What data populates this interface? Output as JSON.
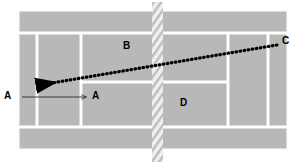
{
  "diagram": {
    "colors": {
      "court_surface": "#b8b8b8",
      "court_line": "#fdfdfd",
      "net_band": "#e8e8e8",
      "net_hatch": "#bdbdbd",
      "trajectory": "#000000",
      "arrow": "#2b2b2b",
      "label_text": "#000000",
      "background": "#ffffff"
    },
    "court": {
      "x": 18,
      "y": 10,
      "width": 270,
      "height": 140,
      "surface_label": "court-surface",
      "lines": {
        "doubles_alley_top_y": 33,
        "doubles_alley_bottom_y": 127,
        "singles_sideline_left_x": 37,
        "singles_sideline_right_x": 268,
        "service_line_left_x": 81,
        "service_line_right_x": 228,
        "center_service_line_y": 82
      }
    },
    "net": {
      "x": 152,
      "y": 2,
      "width": 11,
      "height": 160,
      "label": "net"
    },
    "labels": [
      {
        "id": "label-a-outside",
        "text": "A",
        "x": 4,
        "y": 91,
        "note": "player A position off-court left"
      },
      {
        "id": "label-a-target",
        "text": "A",
        "x": 92,
        "y": 91,
        "note": "arrow target A inside left service box"
      },
      {
        "id": "label-b",
        "text": "B",
        "x": 123,
        "y": 41,
        "note": "left far service box marker"
      },
      {
        "id": "label-c",
        "text": "C",
        "x": 282,
        "y": 36,
        "note": "trajectory endpoint C, right baseline corner"
      },
      {
        "id": "label-d",
        "text": "D",
        "x": 180,
        "y": 98,
        "note": "right near service box marker"
      }
    ],
    "trajectory": {
      "id": "trajectory-c-to-a",
      "style": "dotted",
      "from": {
        "label": "C",
        "x": 277,
        "y": 45
      },
      "to": {
        "label": "A",
        "x": 36,
        "y": 86
      },
      "arrowhead_at": "to",
      "dot_count": 58
    },
    "movement_arrow": {
      "id": "arrow-a-movement",
      "style": "solid-thin",
      "from": {
        "x": 22,
        "y": 97
      },
      "to": {
        "x": 88,
        "y": 97
      },
      "arrowhead_at": "to"
    }
  }
}
